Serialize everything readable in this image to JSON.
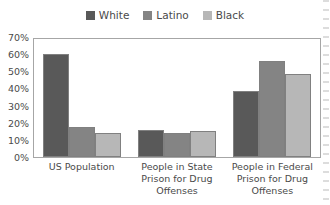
{
  "chart_data": {
    "type": "bar",
    "title": "",
    "subtitle": "",
    "xlabel": "",
    "ylabel": "",
    "ylim": [
      0,
      70
    ],
    "ytick_values": [
      70,
      60,
      50,
      40,
      30,
      20,
      10,
      0
    ],
    "ytick_labels": [
      "70%",
      "60%",
      "50%",
      "40%",
      "30%",
      "20%",
      "10%",
      "0%"
    ],
    "grid": false,
    "legend_position": "top-center",
    "value_suffix": "%",
    "categories": [
      "US Population",
      "People in State Prison for Drug Offenses",
      "People in Federal Prison for Drug Offenses"
    ],
    "series": [
      {
        "name": "White",
        "color": "#595959",
        "values": [
          61,
          16,
          39
        ]
      },
      {
        "name": "Latino",
        "color": "#848484",
        "values": [
          18,
          14.5,
          57
        ]
      },
      {
        "name": "Black",
        "color": "#b7b7b7",
        "values": [
          14,
          15.5,
          49
        ]
      }
    ]
  },
  "legend": {
    "items": [
      {
        "label": "White"
      },
      {
        "label": "Latino"
      },
      {
        "label": "Black"
      }
    ]
  },
  "xaxis": {
    "labels": [
      "US Population",
      "People in State Prison for Drug Offenses",
      "People in Federal Prison for Drug Offenses"
    ]
  },
  "style": {
    "plot_border_color": "#a6a6a6",
    "bar_outline_color": "#808080",
    "text_color": "#4a4a4a",
    "background": "#ffffff"
  }
}
